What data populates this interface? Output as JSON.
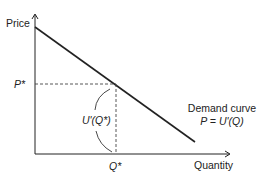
{
  "diagram": {
    "type": "demand-curve",
    "y_axis_label": "Price",
    "x_axis_label": "Quantity",
    "p_star_label": "P*",
    "q_star_label": "Q*",
    "area_label": "U'(Q*)",
    "curve_label_line1": "Demand curve",
    "curve_label_line2": "P = U'(Q)",
    "colors": {
      "line": "#222222",
      "dashed": "#444444",
      "background": "#ffffff"
    }
  }
}
